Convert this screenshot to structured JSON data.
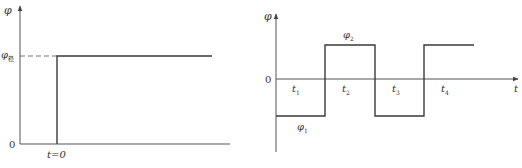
{
  "left_plot": {
    "y_axis_label": "φ",
    "level_label": "φ",
    "level_subscript": "稳",
    "origin_label": "0",
    "step_label": "t=0"
  },
  "right_plot": {
    "y_axis_label": "φ",
    "x_axis_label": "t",
    "origin_label": "0",
    "low_label": "φ",
    "low_subscript": "1",
    "high_label": "φ",
    "high_subscript": "2",
    "intervals": [
      {
        "label": "t",
        "sub": "1"
      },
      {
        "label": "t",
        "sub": "2"
      },
      {
        "label": "t",
        "sub": "3"
      },
      {
        "label": "t",
        "sub": "4"
      }
    ]
  },
  "colors": {
    "line": "#3a3a3a",
    "axis": "#555555",
    "dash": "#777777"
  }
}
